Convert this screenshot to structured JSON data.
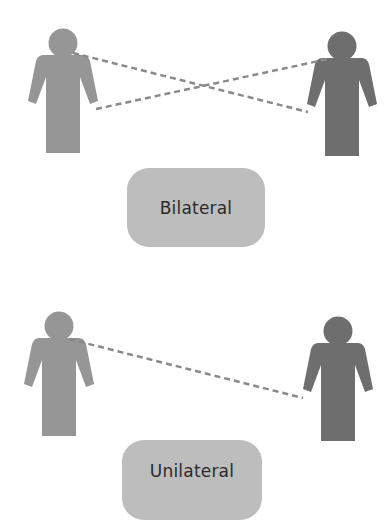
{
  "diagram": {
    "colors": {
      "background": "#ffffff",
      "sender_figure": "#969696",
      "receiver_figure": "#6e6e6e",
      "dashed_line": "#8a8a8a",
      "label_box": "#bdbdbd",
      "label_text": "#2a2a2a"
    },
    "panels": [
      {
        "id": "bilateral",
        "label": "Bilateral",
        "connections": [
          {
            "from": "left-figure-shoulder",
            "to": "right-figure-hand"
          },
          {
            "from": "left-figure-hand",
            "to": "right-figure-shoulder"
          }
        ]
      },
      {
        "id": "unilateral",
        "label": "Unilateral",
        "connections": [
          {
            "from": "left-figure-shoulder",
            "to": "right-figure-hand"
          }
        ]
      }
    ]
  }
}
